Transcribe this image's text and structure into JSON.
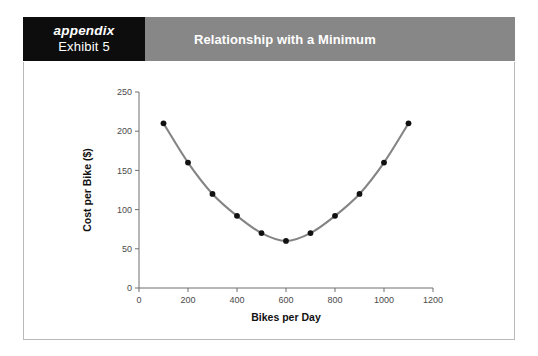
{
  "header": {
    "appendix_word": "appendix",
    "exhibit_number": "Exhibit 5",
    "title": "Relationship with a Minimum",
    "label_box_color": "#0d0d0d",
    "title_box_color": "#878787",
    "text_color": "#ffffff"
  },
  "chart_data": {
    "type": "line",
    "title": "Relationship with a Minimum",
    "xlabel": "Bikes per Day",
    "ylabel": "Cost per Bike ($)",
    "x": [
      100,
      200,
      300,
      400,
      500,
      600,
      700,
      800,
      900,
      1000,
      1100
    ],
    "values": [
      210,
      160,
      120,
      92,
      70,
      60,
      70,
      92,
      120,
      160,
      210
    ],
    "series": [
      {
        "name": "Cost per Bike",
        "values": [
          210,
          160,
          120,
          92,
          70,
          60,
          70,
          92,
          120,
          160,
          210
        ]
      }
    ],
    "xlim": [
      0,
      1200
    ],
    "ylim": [
      0,
      250
    ],
    "xticks": [
      0,
      200,
      400,
      600,
      800,
      1000,
      1200
    ],
    "yticks": [
      0,
      50,
      100,
      150,
      200,
      250
    ],
    "xtick_labels": [
      "0",
      "200",
      "400",
      "600",
      "800",
      "1000",
      "1200"
    ],
    "ytick_labels": [
      "0",
      "50",
      "100",
      "150",
      "200",
      "250"
    ],
    "grid": false,
    "legend": false,
    "marker": "circle",
    "marker_color": "#111111",
    "line_color": "#848484",
    "minimum_point": {
      "x": 600,
      "y": 60
    }
  }
}
